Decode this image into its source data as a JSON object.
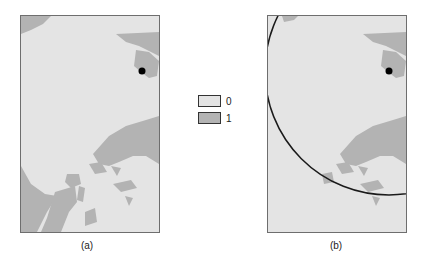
{
  "figure": {
    "panels": [
      {
        "id": "a",
        "caption": "(a)",
        "has_circle": false
      },
      {
        "id": "b",
        "caption": "(b)",
        "has_circle": true
      }
    ],
    "colors": {
      "class_0": "#e4e4e4",
      "class_1": "#b3b3b3",
      "point": "#000000",
      "circle": "#1a1a1a"
    }
  },
  "legend": {
    "items": [
      {
        "label": "0",
        "color": "#e4e4e4"
      },
      {
        "label": "1",
        "color": "#b3b3b3"
      }
    ]
  }
}
